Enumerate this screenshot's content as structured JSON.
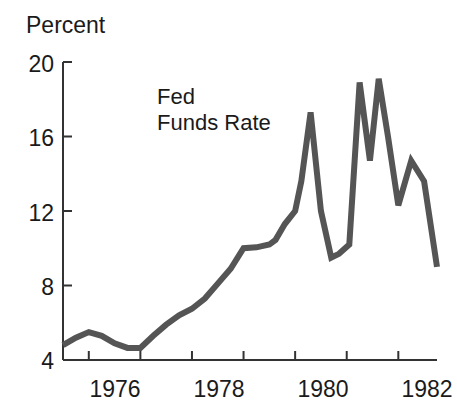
{
  "chart_data": {
    "type": "line",
    "title": "",
    "ylabel": "Percent",
    "xlabel": "",
    "ylim": [
      4,
      20
    ],
    "xlim": [
      1975.5,
      1982.75
    ],
    "ytick_values": [
      4,
      8,
      12,
      16,
      20
    ],
    "ytick_labels": [
      "4",
      "8",
      "12",
      "16",
      "20"
    ],
    "xtick_values": [
      1976,
      1977,
      1978,
      1979,
      1980,
      1981,
      1982
    ],
    "xtick_labels": [
      "1976",
      "",
      "1978",
      "",
      "1980",
      "",
      "1982"
    ],
    "xtick_labels_shown": [
      "1976",
      "1978",
      "1980",
      "1982"
    ],
    "grid": false,
    "legend": "none",
    "annotations": [
      {
        "text": "Fed Funds Rate",
        "line1": "Fed",
        "line2": "Funds Rate",
        "x": 1978.1,
        "y": 17.6
      }
    ],
    "series": [
      {
        "name": "Fed Funds Rate",
        "color": "#555555",
        "line_width": 6,
        "x": [
          1975.5,
          1975.75,
          1976.0,
          1976.25,
          1976.5,
          1976.75,
          1977.0,
          1977.25,
          1977.5,
          1977.75,
          1978.0,
          1978.25,
          1978.5,
          1978.75,
          1979.0,
          1979.25,
          1979.5,
          1979.62,
          1979.8,
          1980.0,
          1980.12,
          1980.3,
          1980.5,
          1980.7,
          1980.85,
          1981.05,
          1981.25,
          1981.45,
          1981.62,
          1981.8,
          1982.0,
          1982.25,
          1982.5,
          1982.75
        ],
        "values": [
          4.8,
          5.2,
          5.5,
          5.3,
          4.9,
          4.65,
          4.65,
          5.3,
          5.9,
          6.4,
          6.75,
          7.3,
          8.1,
          8.9,
          10.0,
          10.05,
          10.2,
          10.45,
          11.3,
          12.0,
          13.6,
          17.3,
          12.0,
          9.5,
          9.7,
          10.2,
          18.9,
          14.7,
          19.1,
          16.0,
          12.3,
          14.7,
          13.6,
          9.0
        ]
      }
    ]
  },
  "labels": {
    "ylabel": "Percent",
    "ytick_0": "4",
    "ytick_1": "8",
    "ytick_2": "12",
    "ytick_3": "16",
    "ytick_4": "20",
    "xtick_0": "1976",
    "xtick_1": "1978",
    "xtick_2": "1980",
    "xtick_3": "1982",
    "annotation_line1": "Fed",
    "annotation_line2": "Funds Rate"
  },
  "colors": {
    "line": "#555555",
    "axis": "#333333",
    "text": "#1a1a1a",
    "background": "#ffffff"
  }
}
